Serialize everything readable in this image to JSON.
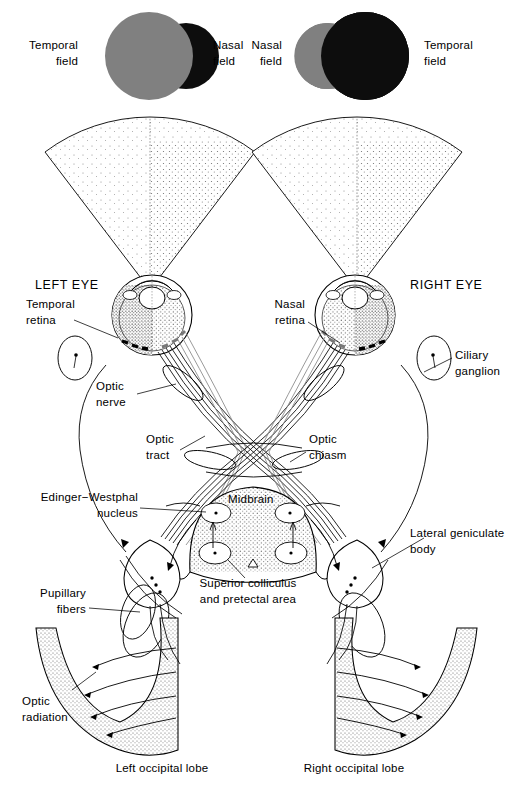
{
  "figure": {
    "colors": {
      "ink": "#000000",
      "background": "#ffffff",
      "field_gray": "#808080",
      "field_black": "#0d0d0d",
      "stipple": "#6f6f6f"
    }
  },
  "visual_fields": {
    "left_diagram": {
      "temporal_label": "Temporal\nfield",
      "nasal_label": "Nasal\nfield",
      "temporal_color": "#808080",
      "nasal_color": "#0d0d0d"
    },
    "right_diagram": {
      "nasal_label": "Nasal\nfield",
      "temporal_label": "Temporal\nfield",
      "nasal_color": "#808080",
      "temporal_color": "#0d0d0d"
    }
  },
  "eyes": {
    "left": {
      "title": "LEFT EYE",
      "retina_label": "Temporal\nretina"
    },
    "right": {
      "title": "RIGHT EYE",
      "retina_label": "Nasal\nretina"
    }
  },
  "structures": {
    "optic_nerve": "Optic\nnerve",
    "optic_tract": "Optic\ntract",
    "optic_chiasm": "Optic\nchiasm",
    "ciliary_ganglion": "Ciliary\nganglion",
    "edinger_westphal": "Edinger−Westphal\nnucleus",
    "midbrain": "Midbrain",
    "superior_colliculus": "Superior colliculus\nand pretectal area",
    "lateral_geniculate": "Lateral geniculate\nbody",
    "pupillary_fibers": "Pupillary\nfibers",
    "optic_radiation": "Optic\nradiation"
  },
  "lobes": {
    "left": "Left occipital lobe",
    "right": "Right occipital lobe"
  }
}
